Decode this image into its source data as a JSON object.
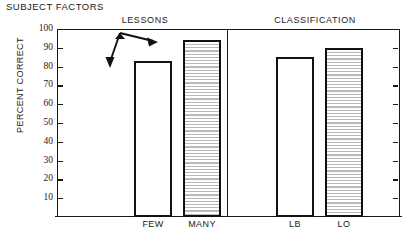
{
  "figure": {
    "title": "SUBJECT FACTORS",
    "ylabel": "PERCENT CORRECT"
  },
  "panels": [
    {
      "name": "lessons",
      "header": "LESSONS"
    },
    {
      "name": "classification",
      "header": "CLASSIFICATION"
    }
  ],
  "axis": {
    "ticks": [
      "100",
      "90",
      "80",
      "70",
      "60",
      "50",
      "40",
      "30",
      "20",
      "10"
    ]
  },
  "annotation": {
    "type": "double-headed-arrow",
    "description": "double-headed arrow linking FEW bar top and MANY bar top"
  },
  "colors": {
    "ink": "#111111",
    "hatch": "#b9b9b9",
    "background": "#ffffff"
  },
  "chart_data": {
    "type": "bar",
    "title": "SUBJECT FACTORS",
    "xlabel": "",
    "ylabel": "PERCENT CORRECT",
    "ylim": [
      0,
      100
    ],
    "yticks": [
      10,
      20,
      30,
      40,
      50,
      60,
      70,
      80,
      90,
      100
    ],
    "grid": false,
    "legend": false,
    "panels": [
      {
        "header": "LESSONS",
        "categories": [
          "FEW",
          "MANY"
        ],
        "values": [
          83,
          94
        ],
        "fills": [
          "open",
          "hatched"
        ]
      },
      {
        "header": "CLASSIFICATION",
        "categories": [
          "LB",
          "LO"
        ],
        "values": [
          85,
          90
        ],
        "fills": [
          "open",
          "hatched"
        ]
      }
    ],
    "categories": [
      "FEW",
      "MANY",
      "LB",
      "LO"
    ],
    "values": [
      83,
      94,
      85,
      90
    ],
    "annotations": [
      "double-headed arrow between FEW and MANY bar tops"
    ]
  }
}
